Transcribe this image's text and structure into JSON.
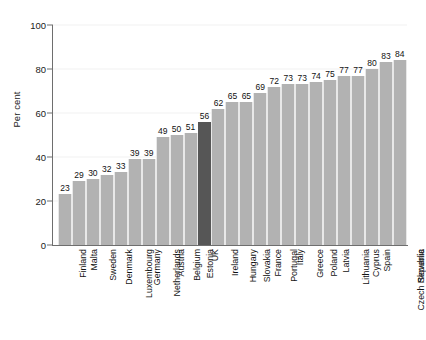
{
  "chart_data": {
    "type": "bar",
    "title": "",
    "xlabel": "",
    "ylabel": "Per cent",
    "ylim": [
      0,
      100
    ],
    "yticks": [
      0,
      20,
      40,
      60,
      80,
      100
    ],
    "grid": true,
    "legend": "none",
    "highlight_category": "UK",
    "colors": {
      "bar": "#b2b2b2",
      "highlight_bar": "#565656",
      "axis": "#6e6e6e",
      "gridline": "#f1f1f1",
      "text": "#111111",
      "background": "#ffffff"
    },
    "categories": [
      "Finland",
      "Malta",
      "Sweden",
      "Denmark",
      "Luxembourg",
      "Germany",
      "Netherlands",
      "Austria",
      "Belgium",
      "Estonia",
      "UK",
      "Ireland",
      "Hungary",
      "Slovakia",
      "France",
      "Portugal",
      "Italy",
      "Greece",
      "Poland",
      "Latvia",
      "Lithuania",
      "Cyprus",
      "Spain",
      "Czech Republic",
      "Slovenia"
    ],
    "values": [
      23,
      29,
      30,
      32,
      33,
      39,
      39,
      49,
      50,
      51,
      56,
      62,
      65,
      65,
      69,
      72,
      73,
      73,
      74,
      75,
      77,
      77,
      80,
      83,
      84
    ]
  }
}
